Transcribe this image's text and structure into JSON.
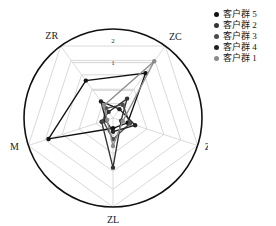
{
  "chart_data": {
    "type": "radar",
    "title": "",
    "categories": [
      "ZC",
      "ZF",
      "ZL",
      "M",
      "ZR"
    ],
    "tick_labels": [
      "1",
      "2"
    ],
    "rmax": 2.6,
    "rings": [
      1,
      2
    ],
    "grid": true,
    "outer_circle": true,
    "legend_position": "right",
    "series": [
      {
        "name": "客户群 5",
        "color": "#111111",
        "values": {
          "ZC": 1.62,
          "ZF": 0.45,
          "ZL": 0.3,
          "M": 1.98,
          "ZR": 1.35
        }
      },
      {
        "name": "客户群 2",
        "color": "#333333",
        "values": {
          "ZC": 0.7,
          "ZF": 0.25,
          "ZL": 1.45,
          "M": 0.35,
          "ZR": 0.22
        }
      },
      {
        "name": "客户群 3",
        "color": "#4a4a4a",
        "values": {
          "ZC": 0.48,
          "ZF": 0.52,
          "ZL": 0.62,
          "M": 0.3,
          "ZR": 0.35
        }
      },
      {
        "name": "客户群 4",
        "color": "#222222",
        "values": {
          "ZC": 0.32,
          "ZF": 0.68,
          "ZL": 0.4,
          "M": 0.22,
          "ZR": 0.6
        }
      },
      {
        "name": "客户群 1",
        "color": "#8c8c8c",
        "values": {
          "ZC": 2.05,
          "ZF": 0.3,
          "ZL": 0.82,
          "M": 0.18,
          "ZR": 0.45
        }
      }
    ]
  },
  "axis_labels": {
    "zc": "ZC",
    "zf": "ZF",
    "zl": "ZL",
    "m": "M",
    "zr": "ZR"
  },
  "ticks": {
    "outer": "2",
    "inner": "1"
  },
  "legend": {
    "items": [
      {
        "label": "客户群 5",
        "color": "#111111"
      },
      {
        "label": "客户群 2",
        "color": "#333333"
      },
      {
        "label": "客户群 3",
        "color": "#4a4a4a"
      },
      {
        "label": "客户群 4",
        "color": "#222222"
      },
      {
        "label": "客户群 1",
        "color": "#8c8c8c"
      }
    ]
  }
}
